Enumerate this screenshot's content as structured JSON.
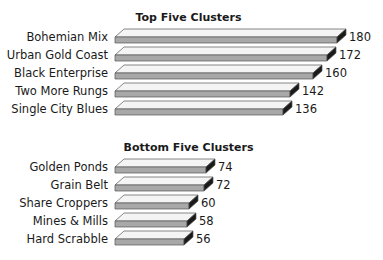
{
  "chart_data": [
    {
      "type": "bar",
      "orientation": "horizontal",
      "title": "Top Five Clusters",
      "categories": [
        "Bohemian Mix",
        "Urban Gold Coast",
        "Black Enterprise",
        "Two More Rungs",
        "Single City Blues"
      ],
      "values": [
        180,
        172,
        160,
        142,
        136
      ],
      "xlabel": "",
      "ylabel": "",
      "grid": false,
      "style": "3d"
    },
    {
      "type": "bar",
      "orientation": "horizontal",
      "title": "Bottom Five Clusters",
      "categories": [
        "Golden Ponds",
        "Grain Belt",
        "Share Croppers",
        "Mines & Mills",
        "Hard Scrabble"
      ],
      "values": [
        74,
        72,
        60,
        58,
        56
      ],
      "xlabel": "",
      "ylabel": "",
      "grid": false,
      "style": "3d"
    }
  ],
  "colors": {
    "top_face": "#f4f4f4",
    "front_face": "#a8a8a8",
    "end_face": "#1a1a1a",
    "outline": "#555555"
  }
}
